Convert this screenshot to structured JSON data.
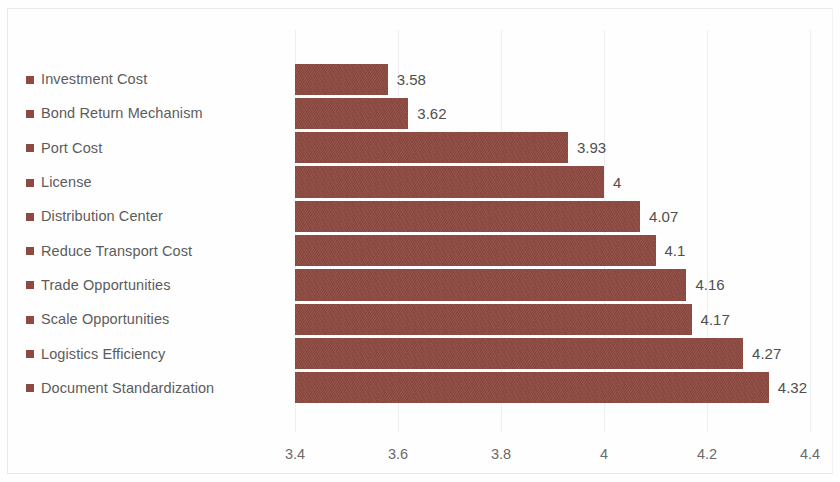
{
  "chart_data": {
    "type": "bar",
    "orientation": "horizontal",
    "title": "",
    "subtitle": "",
    "xlabel": "",
    "ylabel": "",
    "xlim": [
      3.4,
      4.4
    ],
    "xticks": [
      "3.4",
      "3.6",
      "3.8",
      "4",
      "4.2",
      "4.4"
    ],
    "xtick_values": [
      3.4,
      3.6,
      3.8,
      4.0,
      4.2,
      4.4
    ],
    "grid": true,
    "grid_axis": "x",
    "legend_position": "left",
    "series_color": "#8d4a42",
    "categories": [
      "Investment Cost",
      "Bond Return Mechanism",
      "Port Cost",
      "License",
      "Distribution Center",
      "Reduce Transport Cost",
      "Trade Opportunities",
      "Scale Opportunities",
      "Logistics Efficiency",
      "Document Standardization"
    ],
    "values": [
      3.58,
      3.62,
      3.93,
      4,
      4.07,
      4.1,
      4.16,
      4.17,
      4.27,
      4.32
    ],
    "value_labels": [
      "3.58",
      "3.62",
      "3.93",
      "4",
      "4.07",
      "4.1",
      "4.16",
      "4.17",
      "4.27",
      "4.32"
    ]
  },
  "colors": {
    "bar": "#8d4a42",
    "grid": "#efefef",
    "label_text": "#5c5c5c",
    "value_text": "#4f4f4f",
    "tick_text": "#6a6a6a"
  }
}
